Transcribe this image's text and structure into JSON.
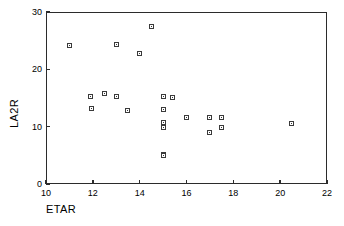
{
  "chart_data": {
    "type": "scatter",
    "title": "",
    "xlabel": "ETAR",
    "ylabel": "LA2R",
    "xlim": [
      10,
      22
    ],
    "ylim": [
      0,
      30
    ],
    "xticks": [
      10,
      12,
      14,
      16,
      18,
      20,
      22
    ],
    "yticks": [
      0,
      10,
      20,
      30
    ],
    "xtick_labels": [
      "10",
      "12",
      "14",
      "16",
      "18",
      "20",
      "22"
    ],
    "ytick_labels": [
      "0",
      "10",
      "20",
      "30"
    ],
    "grid": false,
    "legend": null,
    "marker": "open-square",
    "marker_color": "#3a3a3a",
    "frame_color": "#2b2b2b",
    "background": "#ffffff",
    "points": [
      {
        "x": 11.0,
        "y": 24.2
      },
      {
        "x": 11.9,
        "y": 15.3
      },
      {
        "x": 11.95,
        "y": 13.2
      },
      {
        "x": 12.5,
        "y": 15.7
      },
      {
        "x": 13.0,
        "y": 24.4
      },
      {
        "x": 13.0,
        "y": 15.2
      },
      {
        "x": 13.5,
        "y": 12.9
      },
      {
        "x": 14.0,
        "y": 22.8
      },
      {
        "x": 14.5,
        "y": 27.5
      },
      {
        "x": 15.0,
        "y": 15.3
      },
      {
        "x": 15.0,
        "y": 13.0
      },
      {
        "x": 15.0,
        "y": 10.8
      },
      {
        "x": 15.0,
        "y": 9.8
      },
      {
        "x": 15.0,
        "y": 5.2
      },
      {
        "x": 15.0,
        "y": 4.9
      },
      {
        "x": 15.4,
        "y": 15.1
      },
      {
        "x": 16.0,
        "y": 11.6
      },
      {
        "x": 17.0,
        "y": 11.6
      },
      {
        "x": 17.0,
        "y": 9.0
      },
      {
        "x": 17.5,
        "y": 11.6
      },
      {
        "x": 17.5,
        "y": 9.8
      },
      {
        "x": 20.5,
        "y": 10.6
      }
    ]
  }
}
